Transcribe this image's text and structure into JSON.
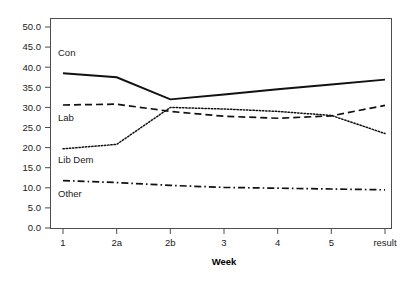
{
  "chart_data": {
    "type": "line",
    "title": "",
    "xlabel": "Week",
    "ylabel": "",
    "categories": [
      "1",
      "2a",
      "2b",
      "3",
      "4",
      "5",
      "result"
    ],
    "x_tick_labels": [
      "1",
      "2a",
      "2b",
      "3",
      "4",
      "5",
      "result"
    ],
    "y_tick_labels": [
      "0.0",
      "5.0",
      "10.0",
      "15.0",
      "20.0",
      "25.0",
      "30.0",
      "35.0",
      "40.0",
      "45.0",
      "50.0"
    ],
    "y_ticks": [
      0,
      5,
      10,
      15,
      20,
      25,
      30,
      35,
      40,
      45,
      50
    ],
    "ylim": [
      0,
      52
    ],
    "grid": false,
    "legend_position": "inline-left",
    "series": [
      {
        "name": "Con",
        "values": [
          38.5,
          37.5,
          32.0,
          33.2,
          34.5,
          35.7,
          36.9
        ],
        "style": "solid",
        "label_x": "1",
        "label_value": 41.5
      },
      {
        "name": "Lab",
        "values": [
          30.6,
          30.8,
          29.0,
          27.8,
          27.3,
          27.9,
          30.5
        ],
        "style": "dashed",
        "label_x": "1",
        "label_value": 26.5
      },
      {
        "name": "Lib Dem",
        "values": [
          19.7,
          20.8,
          30.0,
          29.6,
          29.0,
          28.0,
          23.5
        ],
        "style": "dotted",
        "label_x": "1",
        "label_value": 16.0
      },
      {
        "name": "Other",
        "values": [
          11.8,
          11.3,
          10.6,
          10.1,
          9.9,
          9.7,
          9.5
        ],
        "style": "dashdot",
        "label_x": "1",
        "label_value": 7.5
      }
    ]
  },
  "axes": {
    "x_title": "Week"
  }
}
